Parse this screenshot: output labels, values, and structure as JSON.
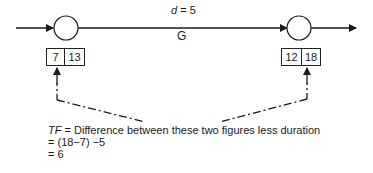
{
  "activity": {
    "duration_label": "d = 5",
    "duration_var": "d",
    "duration_value": "= 5",
    "name": "G"
  },
  "start_event": {
    "earliest": "7",
    "latest": "13"
  },
  "end_event": {
    "earliest": "12",
    "latest": "18"
  },
  "note": {
    "term": "TF",
    "line1": " = Difference between these two figures less duration",
    "line2": "= (18−7) −5",
    "line3": "= 6"
  },
  "colors": {
    "line": "#1a1a1a",
    "background": "#ffffff"
  }
}
